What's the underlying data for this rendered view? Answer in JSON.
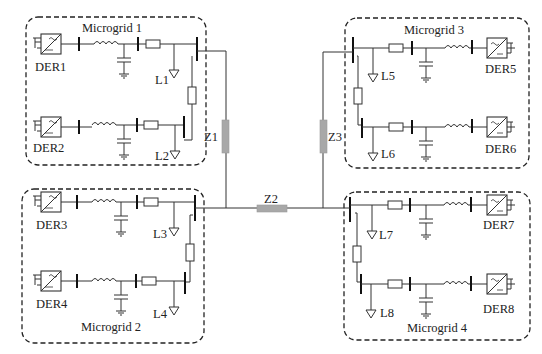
{
  "diagram": {
    "type": "networked microgrid single-line diagram",
    "microgrids": [
      {
        "label": "Microgrid 1",
        "ders": [
          "DER1",
          "DER2"
        ],
        "loads": [
          "L1",
          "L2"
        ]
      },
      {
        "label": "Microgrid 2",
        "ders": [
          "DER3",
          "DER4"
        ],
        "loads": [
          "L3",
          "L4"
        ]
      },
      {
        "label": "Microgrid 3",
        "ders": [
          "DER5",
          "DER6"
        ],
        "loads": [
          "L5",
          "L6"
        ]
      },
      {
        "label": "Microgrid 4",
        "ders": [
          "DER7",
          "DER8"
        ],
        "loads": [
          "L7",
          "L8"
        ]
      }
    ],
    "tie_impedances": [
      "Z1",
      "Z2",
      "Z3"
    ],
    "colors": {
      "line": "#333333",
      "impedance": "#a8a8a8",
      "background": "#ffffff"
    }
  }
}
